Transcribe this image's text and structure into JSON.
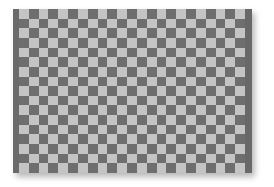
{
  "image": {
    "description": "Gray checkerboard pattern panel with darker vertical edge strips and a soft drop shadow",
    "board": {
      "columns": 23,
      "rows": 17,
      "first_cell": "light"
    },
    "colors": {
      "background": "#ffffff",
      "light_square": "#c4c4c4",
      "dark_square": "#6e6e6e",
      "edge_strip": "#696969"
    }
  }
}
